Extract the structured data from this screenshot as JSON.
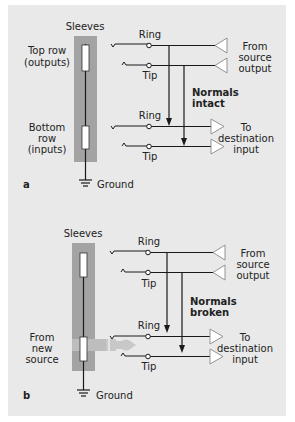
{
  "figure": {
    "background_color": "#e9e9e9",
    "sleeve_bar_color": "#a3a3a3"
  },
  "panel_a": {
    "letter": "a",
    "sleeves_label": "Sleeves",
    "top_row_label_1": "Top row",
    "top_row_label_2": "(outputs)",
    "bottom_row_label_1": "Bottom",
    "bottom_row_label_2": "row",
    "bottom_row_label_3": "(inputs)",
    "ground_label": "Ground",
    "top_ring_label": "Ring",
    "top_tip_label": "Tip",
    "bottom_ring_label": "Ring",
    "bottom_tip_label": "Tip",
    "source_label_1": "From",
    "source_label_2": "source",
    "source_label_3": "output",
    "dest_label_1": "To",
    "dest_label_2": "destination",
    "dest_label_3": "input",
    "normals_label_1": "Normals",
    "normals_label_2": "intact"
  },
  "panel_b": {
    "letter": "b",
    "sleeves_label": "Sleeves",
    "new_source_label_1": "From",
    "new_source_label_2": "new",
    "new_source_label_3": "source",
    "ground_label": "Ground",
    "top_ring_label": "Ring",
    "top_tip_label": "Tip",
    "bottom_ring_label": "Ring",
    "bottom_tip_label": "Tip",
    "source_label_1": "From",
    "source_label_2": "source",
    "source_label_3": "output",
    "dest_label_1": "To",
    "dest_label_2": "destination",
    "dest_label_3": "input",
    "normals_label_1": "Normals",
    "normals_label_2": "broken"
  }
}
